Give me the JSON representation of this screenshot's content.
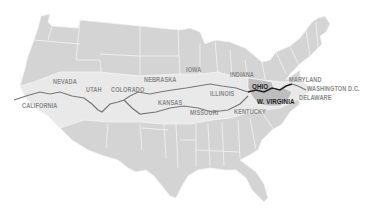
{
  "map": {
    "title": "",
    "colors": {
      "background": "#ffffff",
      "state_fill": "#d4d4d4",
      "route_band_fill": "#e9e9e9",
      "highlight_fill": "#bdbdbd",
      "border": "#f4f4f4",
      "route_line": "#777777",
      "route_highlight_line": "#222222",
      "label": "#8a8a8a",
      "label_dark": "#1a1a1a"
    },
    "labels": [
      {
        "id": "california",
        "text": "CALIFORNIA",
        "x": 22,
        "y": 104,
        "style": "normal"
      },
      {
        "id": "nevada",
        "text": "NEVADA",
        "x": 53,
        "y": 80,
        "style": "normal"
      },
      {
        "id": "utah",
        "text": "UTAH",
        "x": 86,
        "y": 88,
        "style": "normal"
      },
      {
        "id": "colorado",
        "text": "COLORADO",
        "x": 111,
        "y": 88,
        "style": "normal"
      },
      {
        "id": "nebraska",
        "text": "NEBRASKA",
        "x": 144,
        "y": 78,
        "style": "normal"
      },
      {
        "id": "iowa",
        "text": "IOWA",
        "x": 186,
        "y": 68,
        "style": "normal"
      },
      {
        "id": "kansas",
        "text": "KANSAS",
        "x": 158,
        "y": 101,
        "style": "normal"
      },
      {
        "id": "missouri",
        "text": "MISSOURI",
        "x": 190,
        "y": 111,
        "style": "normal"
      },
      {
        "id": "illinois",
        "text": "ILLINOIS",
        "x": 210,
        "y": 92,
        "style": "normal"
      },
      {
        "id": "indiana",
        "text": "INDIANA",
        "x": 230,
        "y": 73,
        "style": "normal"
      },
      {
        "id": "kentucky",
        "text": "KENTUCKY",
        "x": 234,
        "y": 110,
        "style": "normal"
      },
      {
        "id": "ohio",
        "text": "OHIO",
        "x": 252,
        "y": 84,
        "style": "dark"
      },
      {
        "id": "w_virginia",
        "text": "W. VIRGINIA",
        "x": 257,
        "y": 99,
        "style": "dark"
      },
      {
        "id": "maryland",
        "text": "MARYLAND",
        "x": 289,
        "y": 78,
        "style": "normal"
      },
      {
        "id": "washington_dc",
        "text": "WASHINGTON D.C.",
        "x": 307,
        "y": 87,
        "style": "normal"
      },
      {
        "id": "delaware",
        "text": "DELAWARE",
        "x": 299,
        "y": 96,
        "style": "normal"
      }
    ]
  }
}
